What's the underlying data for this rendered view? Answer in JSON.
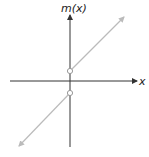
{
  "graph": {
    "y_label": "m(x)",
    "x_label": "x",
    "colors": {
      "axis": "#333333",
      "line": "#bbbbbb",
      "open_point_fill": "#ffffff"
    },
    "description": "Piecewise linear function with jump discontinuity at x = 0; open circles at both ends of the jump",
    "segments": [
      {
        "name": "upper",
        "from": "open point above origin",
        "direction": "up-right"
      },
      {
        "name": "lower",
        "from": "open point below origin",
        "direction": "down-left"
      }
    ]
  }
}
